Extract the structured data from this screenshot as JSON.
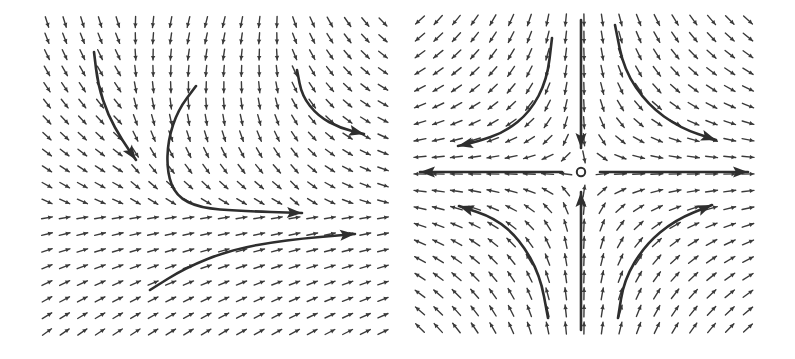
{
  "figure": {
    "width": 795,
    "height": 359,
    "ink_color": "#3a3a3a",
    "background": "#ffffff"
  },
  "panels": [
    {
      "id": "left",
      "description": "Non-linear vector field with flow converging toward a horizontal rightward stream",
      "grid": {
        "x0": 47,
        "x1": 383,
        "cols": 20,
        "y0": 22,
        "y1": 332,
        "rows": 20
      },
      "arrow_length": 11,
      "field": "left",
      "trajectories": [
        {
          "points": [
            [
              94,
              52
            ],
            [
              98,
              85
            ],
            [
              108,
              115
            ],
            [
              122,
              140
            ],
            [
              136,
              160
            ]
          ],
          "head": true
        },
        {
          "points": [
            [
              196,
              86
            ],
            [
              178,
              110
            ],
            [
              168,
              140
            ],
            [
              167,
              172
            ],
            [
              176,
              196
            ],
            [
              200,
              208
            ],
            [
              240,
              211
            ],
            [
              302,
              213
            ]
          ],
          "head": true
        },
        {
          "points": [
            [
              297,
              70
            ],
            [
              302,
              96
            ],
            [
              318,
              116
            ],
            [
              340,
              128
            ],
            [
              364,
              134
            ]
          ],
          "head": true
        },
        {
          "points": [
            [
              150,
              290
            ],
            [
              185,
              268
            ],
            [
              230,
              250
            ],
            [
              285,
              240
            ],
            [
              355,
              234
            ]
          ],
          "head": true
        }
      ]
    },
    {
      "id": "right",
      "description": "Saddle point phase portrait: inflow along vertical axis, outflow along horizontal axis",
      "grid": {
        "x0": 420,
        "x1": 748,
        "cols": 19,
        "y0": 20,
        "y1": 328,
        "rows": 19
      },
      "arrow_length": 12,
      "field": "saddle",
      "center": [
        581,
        172
      ],
      "center_marker": "open-circle",
      "trajectories": [
        {
          "points": [
            [
              552,
              38
            ],
            [
              547,
              80
            ],
            [
              530,
              112
            ],
            [
              505,
              132
            ],
            [
              476,
              142
            ],
            [
              458,
              146
            ]
          ],
          "head": true
        },
        {
          "points": [
            [
              615,
              25
            ],
            [
              624,
              70
            ],
            [
              648,
              105
            ],
            [
              680,
              128
            ],
            [
              716,
              140
            ]
          ],
          "head": true
        },
        {
          "points": [
            [
              548,
              318
            ],
            [
              540,
              275
            ],
            [
              520,
              240
            ],
            [
              495,
              218
            ],
            [
              459,
              206
            ]
          ],
          "head": true
        },
        {
          "points": [
            [
              618,
              318
            ],
            [
              624,
              280
            ],
            [
              645,
              245
            ],
            [
              675,
              220
            ],
            [
              712,
              205
            ]
          ],
          "head": true
        },
        {
          "points": [
            [
              581,
              20
            ],
            [
              581,
              148
            ]
          ],
          "head": true
        },
        {
          "points": [
            [
              581,
              330
            ],
            [
              581,
              192
            ]
          ],
          "head": true
        },
        {
          "points": [
            [
              562,
              172
            ],
            [
              420,
              172
            ]
          ],
          "head": true
        },
        {
          "points": [
            [
              600,
              172
            ],
            [
              748,
              172
            ]
          ],
          "head": true
        }
      ]
    }
  ]
}
